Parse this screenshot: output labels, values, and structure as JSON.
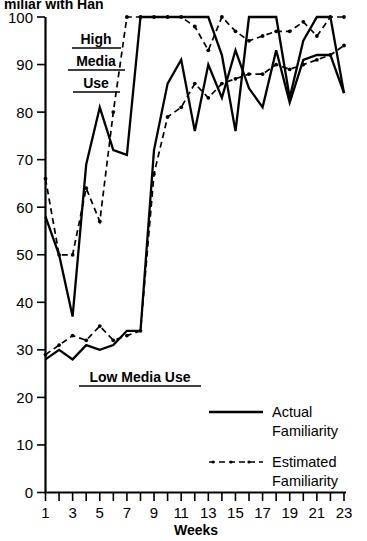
{
  "figure": {
    "top_cut_text": "miliar with Han",
    "annotations": [
      {
        "name": "high-media-use",
        "lines": [
          "High",
          "Media",
          "Use"
        ]
      },
      {
        "name": "low-media-use",
        "lines": [
          "Low Media Use"
        ]
      }
    ]
  },
  "legend": {
    "position": "bottom-right",
    "entries": [
      {
        "name": "actual-familiarity",
        "label_line1": "Actual",
        "label_line2": "Familiarity",
        "style": "solid"
      },
      {
        "name": "estimated-familiarity",
        "label_line1": "Estimated",
        "label_line2": "Familiarity",
        "style": "dashed"
      }
    ]
  },
  "chart_data": {
    "type": "line",
    "title": "",
    "xlabel": "Weeks",
    "ylabel": "",
    "xlim": [
      1,
      23
    ],
    "ylim": [
      0,
      100
    ],
    "ytick_values": [
      0,
      10,
      20,
      30,
      40,
      50,
      60,
      70,
      80,
      90,
      100
    ],
    "ytick_labels": [
      "0",
      "10",
      "20",
      "30",
      "40",
      "50",
      "60",
      "70",
      "80",
      "90",
      "100"
    ],
    "xtick_values": [
      1,
      2,
      3,
      4,
      5,
      6,
      7,
      8,
      9,
      10,
      11,
      12,
      13,
      14,
      15,
      16,
      17,
      18,
      19,
      20,
      21,
      22,
      23
    ],
    "xtick_labels": [
      "1",
      "",
      "3",
      "",
      "5",
      "",
      "7",
      "",
      "9",
      "",
      "11",
      "",
      "13",
      "",
      "15",
      "",
      "17",
      "",
      "19",
      "",
      "21",
      "",
      "23"
    ],
    "grid": false,
    "x": [
      1,
      2,
      3,
      4,
      5,
      6,
      7,
      8,
      9,
      10,
      11,
      12,
      13,
      14,
      15,
      16,
      17,
      18,
      19,
      20,
      21,
      22,
      23
    ],
    "series": [
      {
        "name": "High Media Use - Actual Familiarity",
        "style": "solid",
        "markers": false,
        "values": [
          58,
          50,
          37,
          69,
          81,
          72,
          71,
          100,
          100,
          100,
          100,
          100,
          100,
          92,
          76,
          100,
          100,
          100,
          83,
          95,
          100,
          100,
          84
        ]
      },
      {
        "name": "High Media Use - Estimated Familiarity",
        "style": "dashed",
        "markers": true,
        "values": [
          66,
          50,
          50,
          64,
          57,
          80,
          100,
          100,
          100,
          100,
          100,
          98,
          93,
          100,
          97,
          95,
          96,
          97,
          97,
          99,
          96,
          100,
          100
        ]
      },
      {
        "name": "Low Media Use - Actual Familiarity",
        "style": "solid",
        "markers": false,
        "values": [
          28,
          30,
          28,
          31,
          30,
          31,
          34,
          34,
          72,
          86,
          91,
          76,
          90,
          83,
          93,
          85,
          81,
          93,
          82,
          91,
          92,
          92,
          84
        ]
      },
      {
        "name": "Low Media Use - Estimated Familiarity",
        "style": "dashed",
        "markers": true,
        "values": [
          29,
          31,
          33,
          32,
          35,
          32,
          33,
          34,
          67,
          79,
          81,
          86,
          83,
          86,
          87,
          88,
          88,
          90,
          89,
          90,
          91,
          92,
          94
        ]
      }
    ]
  }
}
